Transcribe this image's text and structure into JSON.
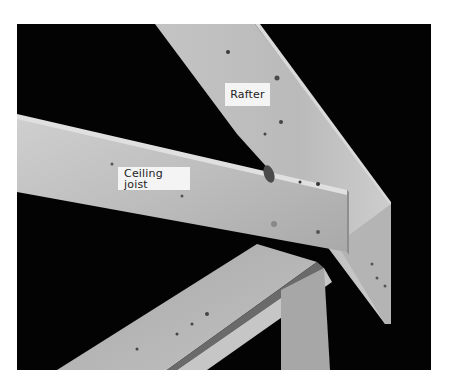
{
  "image": {
    "description": "Grayscale photo of wood roof framing: a ceiling joist nailed alongside a sloped rafter resting on a top plate",
    "background_color": "#030303",
    "page_color": "#ffffff"
  },
  "labels": {
    "rafter": "Rafter",
    "ceiling_joist": "Ceiling joist"
  }
}
